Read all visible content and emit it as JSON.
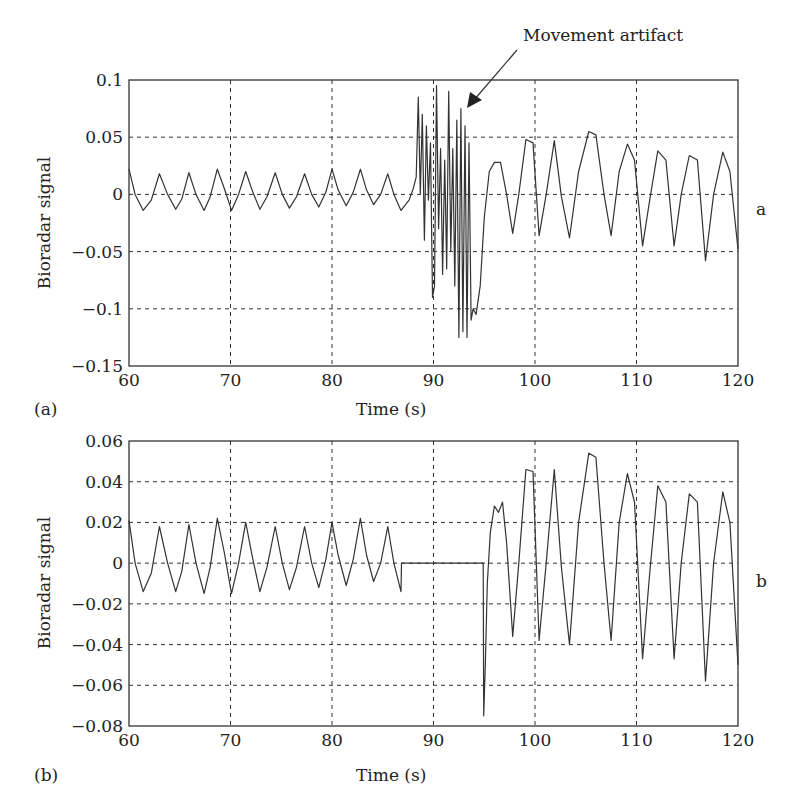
{
  "figure": {
    "annotation": "Movement artifact",
    "panels": [
      {
        "tag": "(a)",
        "side_label": "a"
      },
      {
        "tag": "(b)",
        "side_label": "b"
      }
    ]
  },
  "chart_data": [
    {
      "type": "line",
      "panel": "(a)",
      "title": "",
      "xlabel": "Time (s)",
      "ylabel": "Bioradar signal",
      "xlim": [
        60,
        120
      ],
      "ylim": [
        -0.15,
        0.1
      ],
      "xticks": [
        60,
        70,
        80,
        90,
        100,
        110,
        120
      ],
      "yticks": [
        0.1,
        0.05,
        0,
        -0.05,
        -0.1,
        -0.15
      ],
      "ytick_labels": [
        "0.1",
        "0.05",
        "0",
        "−0.05",
        "−0.1",
        "−0.15"
      ],
      "grid": true,
      "annotation": {
        "text": "Movement artifact",
        "arrow_to": [
          92.8,
          0.07
        ]
      },
      "side_label": "a",
      "series": [
        {
          "name": "Bioradar signal",
          "x": [
            60.0,
            60.6,
            61.4,
            62.2,
            63.0,
            63.8,
            64.6,
            65.2,
            65.9,
            66.6,
            67.4,
            68.0,
            68.7,
            69.4,
            70.1,
            70.8,
            71.5,
            72.2,
            72.9,
            73.6,
            74.4,
            75.1,
            75.8,
            76.5,
            77.3,
            78.0,
            78.7,
            79.4,
            80.0,
            80.6,
            81.4,
            82.1,
            82.8,
            83.4,
            84.1,
            84.8,
            85.5,
            86.1,
            86.8,
            87.6,
            88.0,
            88.3,
            88.5,
            88.7,
            88.9,
            89.1,
            89.3,
            89.5,
            89.7,
            89.9,
            90.1,
            90.3,
            90.5,
            90.7,
            90.9,
            91.1,
            91.3,
            91.5,
            91.7,
            91.9,
            92.1,
            92.3,
            92.5,
            92.7,
            92.9,
            93.1,
            93.3,
            93.5,
            93.7,
            93.9,
            94.2,
            94.6,
            95.0,
            95.5,
            96.0,
            96.6,
            97.2,
            97.8,
            98.4,
            99.1,
            99.8,
            100.4,
            101.1,
            101.9,
            102.6,
            103.4,
            104.3,
            105.3,
            106.0,
            106.8,
            107.5,
            108.3,
            109.1,
            109.8,
            110.6,
            111.3,
            112.1,
            112.9,
            113.7,
            114.4,
            115.2,
            116.0,
            116.8,
            117.6,
            118.5,
            119.2,
            120.0
          ],
          "y": [
            0.022,
            0.0,
            -0.014,
            -0.005,
            0.018,
            0.0,
            -0.013,
            -0.004,
            0.019,
            0.0,
            -0.014,
            -0.002,
            0.022,
            0.005,
            -0.014,
            0.0,
            0.02,
            0.002,
            -0.013,
            -0.002,
            0.019,
            0.0,
            -0.012,
            -0.002,
            0.018,
            0.0,
            -0.011,
            0.002,
            0.022,
            0.004,
            -0.01,
            0.002,
            0.022,
            0.004,
            -0.009,
            0.0,
            0.018,
            0.0,
            -0.014,
            -0.005,
            0.005,
            0.015,
            0.085,
            0.0,
            0.07,
            -0.04,
            0.06,
            -0.005,
            0.045,
            -0.09,
            -0.08,
            0.095,
            -0.03,
            0.04,
            -0.07,
            0.03,
            -0.065,
            0.09,
            -0.05,
            0.04,
            -0.08,
            0.065,
            -0.125,
            0.075,
            -0.12,
            0.06,
            -0.125,
            0.045,
            -0.11,
            -0.1,
            -0.105,
            -0.08,
            -0.02,
            0.02,
            0.028,
            0.028,
            0.0,
            -0.034,
            0.0,
            0.048,
            0.045,
            -0.036,
            0.0,
            0.047,
            -0.002,
            -0.038,
            0.02,
            0.055,
            0.052,
            0.0,
            -0.036,
            0.02,
            0.044,
            0.03,
            -0.045,
            -0.005,
            0.038,
            0.03,
            -0.045,
            0.0,
            0.034,
            0.03,
            -0.058,
            0.0,
            0.037,
            0.02,
            -0.048
          ]
        }
      ]
    },
    {
      "type": "line",
      "panel": "(b)",
      "title": "",
      "xlabel": "Time (s)",
      "ylabel": "Bioradar signal",
      "xlim": [
        60,
        120
      ],
      "ylim": [
        -0.08,
        0.06
      ],
      "xticks": [
        60,
        70,
        80,
        90,
        100,
        110,
        120
      ],
      "yticks": [
        0.06,
        0.04,
        0.02,
        0,
        -0.02,
        -0.04,
        -0.06,
        -0.08
      ],
      "ytick_labels": [
        "0.06",
        "0.04",
        "0.02",
        "0",
        "−0.02",
        "−0.04",
        "−0.06",
        "−0.08"
      ],
      "grid": true,
      "side_label": "b",
      "series": [
        {
          "name": "Bioradar signal (artifact removed)",
          "x": [
            60.0,
            60.6,
            61.4,
            62.2,
            63.0,
            63.8,
            64.6,
            65.2,
            65.9,
            66.6,
            67.4,
            68.0,
            68.7,
            69.4,
            70.1,
            70.8,
            71.5,
            72.2,
            72.9,
            73.6,
            74.4,
            75.1,
            75.8,
            76.5,
            77.3,
            78.0,
            78.7,
            79.4,
            80.0,
            80.6,
            81.4,
            82.1,
            82.8,
            83.4,
            84.1,
            84.8,
            85.5,
            86.1,
            86.8,
            86.85,
            94.9,
            94.95,
            95.1,
            95.3,
            95.6,
            96.0,
            96.4,
            96.8,
            97.2,
            97.8,
            98.4,
            99.1,
            99.8,
            100.4,
            101.1,
            101.9,
            102.6,
            103.4,
            104.3,
            105.3,
            106.0,
            106.8,
            107.5,
            108.3,
            109.1,
            109.8,
            110.6,
            111.3,
            112.1,
            112.9,
            113.7,
            114.4,
            115.2,
            116.0,
            116.8,
            117.6,
            118.5,
            119.2,
            120.0
          ],
          "y": [
            0.021,
            0.0,
            -0.014,
            -0.005,
            0.018,
            0.0,
            -0.014,
            -0.004,
            0.019,
            0.0,
            -0.015,
            -0.002,
            0.022,
            0.005,
            -0.015,
            0.0,
            0.02,
            0.002,
            -0.014,
            -0.002,
            0.018,
            0.0,
            -0.013,
            -0.002,
            0.018,
            0.0,
            -0.012,
            0.002,
            0.02,
            0.004,
            -0.011,
            0.002,
            0.022,
            0.004,
            -0.009,
            0.0,
            0.018,
            0.0,
            -0.014,
            0.0,
            0.0,
            -0.075,
            -0.05,
            -0.01,
            0.015,
            0.028,
            0.025,
            0.03,
            0.01,
            -0.036,
            0.0,
            0.046,
            0.045,
            -0.038,
            0.0,
            0.046,
            -0.002,
            -0.04,
            0.02,
            0.054,
            0.052,
            0.0,
            -0.038,
            0.02,
            0.044,
            0.03,
            -0.047,
            -0.005,
            0.038,
            0.03,
            -0.047,
            0.0,
            0.034,
            0.03,
            -0.058,
            0.0,
            0.035,
            0.02,
            -0.05
          ]
        }
      ]
    }
  ]
}
